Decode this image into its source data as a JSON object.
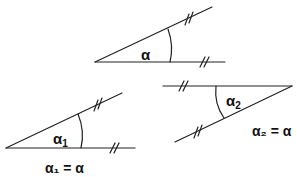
{
  "diagram": {
    "stroke_color": "#222222",
    "figures": [
      {
        "id": "original",
        "angle_label": "α",
        "vertex": [
          95,
          62
        ],
        "ray_horizontal_end": [
          225,
          62
        ],
        "ray_slanted_end": [
          212,
          7
        ],
        "equality_text": ""
      },
      {
        "id": "copy-1",
        "angle_label": "α",
        "angle_subscript": "1",
        "vertex": [
          6,
          148
        ],
        "ray_horizontal_end": [
          135,
          148
        ],
        "ray_slanted_end": [
          122,
          93
        ],
        "equality_text": "α₁ = α"
      },
      {
        "id": "copy-2",
        "angle_label": "α",
        "angle_subscript": "2",
        "vertex": [
          292,
          86
        ],
        "ray_horizontal_end": [
          163,
          86
        ],
        "ray_slanted_end": [
          175,
          142
        ],
        "equality_text": "α₂ = α"
      }
    ],
    "tick_mark": "//"
  }
}
